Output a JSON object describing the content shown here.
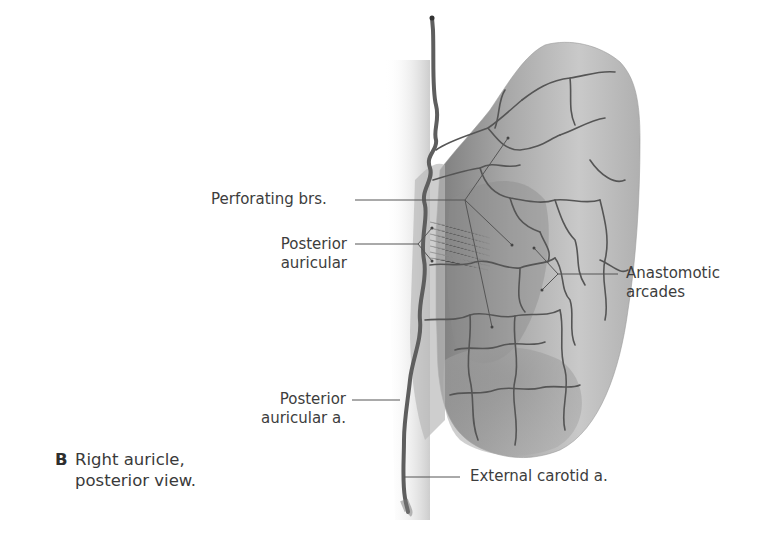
{
  "figure": {
    "panel_letter": "B",
    "caption_line1": "Right auricle,",
    "caption_line2": "posterior view."
  },
  "labels": {
    "perforating": "Perforating brs.",
    "posterior_auricular_1": "Posterior",
    "posterior_auricular_2": "auricular",
    "anastomotic_1": "Anastomotic",
    "anastomotic_2": "arcades",
    "post_auricular_a_1": "Posterior",
    "post_auricular_a_2": "auricular a.",
    "external_carotid": "External carotid a."
  },
  "colors": {
    "background": "#ffffff",
    "text": "#3d3d3d",
    "leader_line": "#555555",
    "skin_light": "#d8d8d8",
    "skin_dark": "#8a8a8a",
    "vessel": "#5a5a5a"
  }
}
